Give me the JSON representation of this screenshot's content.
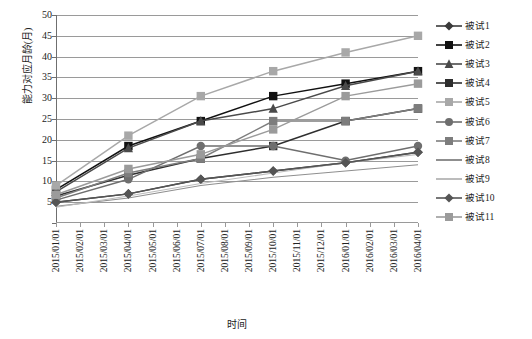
{
  "chart_data": {
    "type": "line",
    "title": "",
    "xlabel": "时间",
    "ylabel": "能力对应月龄(月)",
    "ylim": [
      0,
      50
    ],
    "ytick_step": 5,
    "grid": true,
    "legend_position": "right",
    "y_ticks": [
      "0",
      "5",
      "10",
      "15",
      "20",
      "25",
      "30",
      "35",
      "40",
      "45",
      "50"
    ],
    "x_ticks": [
      "2015/01/01",
      "2015/02/01",
      "2015/03/01",
      "2015/04/01",
      "2015/05/01",
      "2015/06/01",
      "2015/07/01",
      "2015/08/01",
      "2015/09/01",
      "2015/10/01",
      "2015/11/01",
      "2015/12/01",
      "2016/01/01",
      "2016/02/01",
      "2016/03/01",
      "2016/04/01"
    ],
    "x": [
      "2015/01/01",
      "2015/04/01",
      "2015/07/01",
      "2015/10/01",
      "2016/01/01",
      "2016/04/01"
    ],
    "x_indices": [
      0,
      3,
      6,
      9,
      12,
      15
    ],
    "series": [
      {
        "name": "被试1",
        "marker": "diamond",
        "color": "#3a3a3a",
        "values": [
          5.0,
          7.0,
          10.5,
          12.5,
          14.5,
          17.0
        ]
      },
      {
        "name": "被试2",
        "marker": "square",
        "color": "#111111",
        "values": [
          8.0,
          18.5,
          24.5,
          30.5,
          33.5,
          36.5
        ]
      },
      {
        "name": "被试3",
        "marker": "triangle",
        "color": "#4a4a4a",
        "values": [
          7.5,
          18.0,
          24.5,
          27.5,
          33.0,
          36.5
        ]
      },
      {
        "name": "被试4",
        "marker": "square",
        "color": "#2e2e2e",
        "values": [
          6.5,
          11.5,
          15.5,
          18.5,
          24.5,
          27.5
        ]
      },
      {
        "name": "被试5",
        "marker": "x-square",
        "color": "#a8a8a8",
        "values": [
          9.0,
          21.0,
          30.5,
          36.5,
          41.0,
          45.0
        ]
      },
      {
        "name": "被试6",
        "marker": "circle",
        "color": "#6e6e6e",
        "values": [
          5.5,
          10.5,
          18.5,
          18.5,
          15.0,
          18.5
        ]
      },
      {
        "name": "被试7",
        "marker": "square",
        "color": "#7d7d7d",
        "values": [
          6.0,
          12.0,
          15.5,
          24.5,
          24.5,
          27.5
        ]
      },
      {
        "name": "被试8",
        "marker": "none",
        "color": "#8f8f8f",
        "values": [
          4.0,
          6.0,
          9.0,
          11.0,
          12.5,
          14.0
        ]
      },
      {
        "name": "被试9",
        "marker": "none",
        "color": "#bcbcbc",
        "values": [
          3.8,
          6.5,
          9.5,
          12.0,
          14.5,
          16.5
        ]
      },
      {
        "name": "被试10",
        "marker": "diamond",
        "color": "#555555",
        "values": [
          5.0,
          7.0,
          10.5,
          12.5,
          14.5,
          17.0
        ]
      },
      {
        "name": "被试11",
        "marker": "square",
        "color": "#9b9b9b",
        "values": [
          6.8,
          13.0,
          16.5,
          22.5,
          30.5,
          33.5
        ]
      }
    ]
  },
  "legend": {
    "items": [
      {
        "label": "被试1"
      },
      {
        "label": "被试2"
      },
      {
        "label": "被试3"
      },
      {
        "label": "被试4"
      },
      {
        "label": "被试5"
      },
      {
        "label": "被试6"
      },
      {
        "label": "被试7"
      },
      {
        "label": "被试8"
      },
      {
        "label": "被试9"
      },
      {
        "label": "被试10"
      },
      {
        "label": "被试11"
      }
    ]
  }
}
